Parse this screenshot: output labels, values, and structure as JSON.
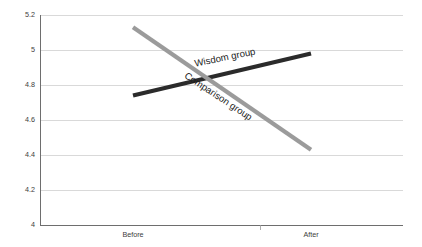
{
  "chart_data": {
    "type": "line",
    "title": "",
    "subtitle": "",
    "xlabel": "",
    "ylabel": "",
    "categories": [
      "Before",
      "After"
    ],
    "x": [
      0,
      1
    ],
    "ylim": [
      4,
      5.2
    ],
    "yticks": [
      4,
      4.2,
      4.4,
      4.6,
      4.8,
      5,
      5.2
    ],
    "ytick_labels": [
      "4",
      "4.2",
      "4.4",
      "4.6",
      "4.8",
      "5",
      "5.2"
    ],
    "xtick_labels": [
      "Before",
      "After"
    ],
    "grid": true,
    "grid_axis": "y",
    "legend": "inline-labels",
    "legend_position": "on-line",
    "series": [
      {
        "name": "Wisdom group",
        "label": "Wisdom group",
        "color": "#2b2b2b",
        "values": [
          4.74,
          4.98
        ],
        "label_angle": -11.5
      },
      {
        "name": "Comparison group",
        "label": "Comparison group",
        "color": "#9b9b9b",
        "values": [
          5.13,
          4.43
        ],
        "label_angle": 33.5
      }
    ],
    "annotations": [
      {
        "text": "Wisdom group",
        "x": 0.52,
        "y": 4.94
      },
      {
        "text": "Comparison group",
        "x": 0.47,
        "y": 4.72
      }
    ]
  },
  "colors": {
    "background": "#ffffff",
    "gridline": "#d0d0d0",
    "axis": "#6e6e6e",
    "tick_label": "#3c3c3c",
    "annotation_text": "#1c1c1c",
    "wisdom_group": "#2b2b2b",
    "comparison_group": "#9b9b9b"
  }
}
